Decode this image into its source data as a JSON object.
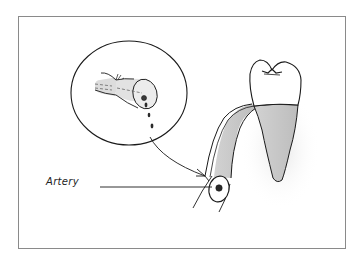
{
  "figure": {
    "labels": [
      {
        "id": "artery",
        "text": "Artery"
      }
    ],
    "elements": {
      "inset_circle": "magnified view of cut vessel with blood droplets",
      "tooth": "molar crown with shaded root",
      "vessel": "shaded vessel curving alongside the tooth",
      "artery_cross_section": "oval with dark center dot"
    },
    "colors": {
      "ink": "#1a1a1a",
      "shading": "#c8c8c8",
      "frame": "#8a8a8a",
      "background": "#ffffff"
    }
  }
}
